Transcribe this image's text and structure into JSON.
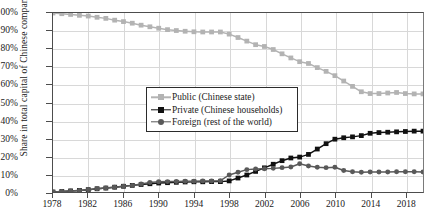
{
  "chart_data": {
    "type": "line",
    "title": "",
    "xlabel": "",
    "ylabel": "Share in total capital of Chinese companies",
    "xlim": [
      1978,
      2020
    ],
    "ylim": [
      0,
      100
    ],
    "grid": true,
    "legend_position": "center-left",
    "x_ticks": [
      "1978",
      "1982",
      "1986",
      "1990",
      "1994",
      "1998",
      "2002",
      "2006",
      "2010",
      "2014",
      "2018"
    ],
    "y_ticks": [
      "0%",
      "10%",
      "20%",
      "30%",
      "40%",
      "50%",
      "60%",
      "70%",
      "80%",
      "90%",
      "100%"
    ],
    "x": [
      1978,
      1979,
      1980,
      1981,
      1982,
      1983,
      1984,
      1985,
      1986,
      1987,
      1988,
      1989,
      1990,
      1991,
      1992,
      1993,
      1994,
      1995,
      1996,
      1997,
      1998,
      1999,
      2000,
      2001,
      2002,
      2003,
      2004,
      2005,
      2006,
      2007,
      2008,
      2009,
      2010,
      2011,
      2012,
      2013,
      2014,
      2015,
      2016,
      2017,
      2018,
      2019,
      2020
    ],
    "series": [
      {
        "name": "Public (Chinese state)",
        "color": "#b3b3b3",
        "marker": "square",
        "values": [
          100,
          99.6,
          99.2,
          98.7,
          98.3,
          97.6,
          97.0,
          96.0,
          95.2,
          94.3,
          93.2,
          92.3,
          91.5,
          90.7,
          90.2,
          89.8,
          89.5,
          89.4,
          89.4,
          89.4,
          88.2,
          86.3,
          84.3,
          82.3,
          81.3,
          79.6,
          77.2,
          74.9,
          72.8,
          71.8,
          69.5,
          67.4,
          65.0,
          62.0,
          59.0,
          56.0,
          55.0,
          55.0,
          55.3,
          55.6,
          55.0,
          54.8,
          54.8
        ]
      },
      {
        "name": "Private (Chinese households)",
        "color": "#111111",
        "marker": "square",
        "values": [
          0,
          0.3,
          0.6,
          0.9,
          1.3,
          1.8,
          2.2,
          2.7,
          3.2,
          3.7,
          4.2,
          4.6,
          5.0,
          5.2,
          5.4,
          5.6,
          5.7,
          5.7,
          5.8,
          5.8,
          6.2,
          7.8,
          9.5,
          11.5,
          13.5,
          15.5,
          17.5,
          19.0,
          19.5,
          21.0,
          24.0,
          27.0,
          29.5,
          30.3,
          30.8,
          31.5,
          32.8,
          33.2,
          33.4,
          33.6,
          33.8,
          34.0,
          34.0
        ]
      },
      {
        "name": "Foreign (rest of the world)",
        "color": "#595959",
        "marker": "circle",
        "values": [
          0,
          0.3,
          0.6,
          0.9,
          1.3,
          1.8,
          2.2,
          2.7,
          3.2,
          3.7,
          4.5,
          5.3,
          5.7,
          5.8,
          5.9,
          6.0,
          6.0,
          6.1,
          6.2,
          6.3,
          9.5,
          11.0,
          12.5,
          12.8,
          13.0,
          13.2,
          13.6,
          14.0,
          15.8,
          14.5,
          13.8,
          13.6,
          13.8,
          12.0,
          11.3,
          11.0,
          11.2,
          11.2,
          11.2,
          11.3,
          11.3,
          11.3,
          11.2
        ]
      }
    ]
  },
  "legend": {
    "items": [
      {
        "label": "Public (Chinese state)"
      },
      {
        "label": "Private (Chinese households)"
      },
      {
        "label": "Foreign (rest of the world)"
      }
    ]
  }
}
